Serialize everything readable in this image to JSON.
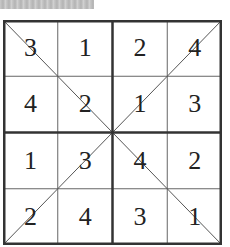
{
  "caption": "",
  "puzzle": {
    "type": "4x4 diagonal sudoku",
    "rows": [
      [
        "3",
        "1",
        "2",
        "4"
      ],
      [
        "4",
        "2",
        "1",
        "3"
      ],
      [
        "1",
        "3",
        "4",
        "2"
      ],
      [
        "2",
        "4",
        "3",
        "1"
      ]
    ]
  },
  "colors": {
    "line": "#333333",
    "thin_line": "#666666",
    "text": "#222222",
    "background": "#ffffff"
  }
}
